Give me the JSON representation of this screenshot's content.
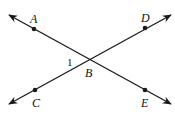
{
  "diagram": {
    "type": "intersecting-lines",
    "stroke_color": "#1a1a1a",
    "background": "#ffffff",
    "intersection": {
      "label": "B",
      "x": 90,
      "y": 60
    },
    "angle_label": {
      "text": "1",
      "x": 68,
      "y": 65
    },
    "lines": [
      {
        "name": "line-AE",
        "from": {
          "x": 9,
          "y": 15
        },
        "to": {
          "x": 171,
          "y": 104
        }
      },
      {
        "name": "line-CD",
        "from": {
          "x": 9,
          "y": 104
        },
        "to": {
          "x": 171,
          "y": 15
        }
      }
    ],
    "points": [
      {
        "label": "A",
        "x": 34,
        "y": 29,
        "label_x": 30,
        "label_y": 22
      },
      {
        "label": "D",
        "x": 145,
        "y": 28,
        "label_x": 141,
        "label_y": 21
      },
      {
        "label": "C",
        "x": 35,
        "y": 90,
        "label_x": 32,
        "label_y": 107
      },
      {
        "label": "E",
        "x": 145,
        "y": 90,
        "label_x": 141,
        "label_y": 107
      }
    ],
    "labels": {
      "A": "A",
      "B": "B",
      "C": "C",
      "D": "D",
      "E": "E",
      "angle1": "1"
    }
  }
}
